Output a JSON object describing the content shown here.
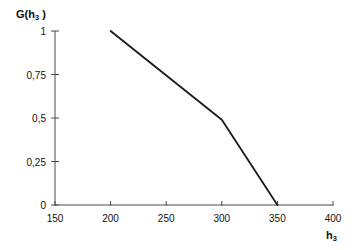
{
  "chart_data": {
    "type": "line",
    "title": "",
    "subtitle": "",
    "xlabel": "h3",
    "ylabel": "G(h3)",
    "xlabel_base": "h",
    "xlabel_sub": "3",
    "ylabel_prefix": "G(h",
    "ylabel_sub": "3",
    "ylabel_suffix": " )",
    "xlim": [
      150,
      400
    ],
    "ylim": [
      0,
      1
    ],
    "grid": false,
    "legend": false,
    "legend_position": "none",
    "decimal_separator": ",",
    "xticks": [
      150,
      200,
      250,
      300,
      350,
      400
    ],
    "xtick_labels": [
      "150",
      "200",
      "250",
      "300",
      "350",
      "400"
    ],
    "yticks": [
      0,
      0.25,
      0.5,
      0.75,
      1
    ],
    "ytick_labels": [
      "0",
      "0,25",
      "0,5",
      "0,75",
      "1"
    ],
    "series": [
      {
        "name": "G(h3)",
        "color": "#1a1a1a",
        "x": [
          200,
          300,
          350
        ],
        "y": [
          1,
          0.49,
          0
        ],
        "points": [
          {
            "x": 200,
            "y": 1
          },
          {
            "x": 300,
            "y": 0.49
          },
          {
            "x": 350,
            "y": 0
          }
        ]
      }
    ],
    "annotations": []
  },
  "style": {
    "axis_color": "#4a4a4a",
    "line_color": "#1a1a1a",
    "text_color": "#111111",
    "background": "#ffffff"
  }
}
